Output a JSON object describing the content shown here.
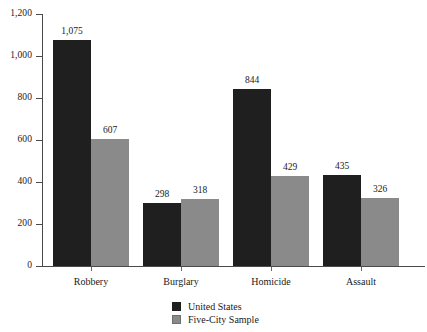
{
  "chart_data": {
    "type": "bar",
    "title": "",
    "xlabel": "",
    "ylabel": "",
    "categories": [
      "Robbery",
      "Burglary",
      "Homicide",
      "Assault"
    ],
    "series": [
      {
        "name": "United States",
        "color": "#1f1f1f",
        "values": [
          1075,
          298,
          844,
          435
        ],
        "labels": [
          "1,075",
          "298",
          "844",
          "435"
        ]
      },
      {
        "name": "Five-City Sample",
        "color": "#8a8a8a",
        "values": [
          607,
          318,
          429,
          326
        ],
        "labels": [
          "607",
          "318",
          "429",
          "326"
        ]
      }
    ],
    "ylim": [
      0,
      1200
    ],
    "yticks": [
      0,
      200,
      400,
      600,
      800,
      1000,
      1200
    ],
    "ytick_labels": [
      "0",
      "200",
      "400",
      "600",
      "800",
      "1,000",
      "1,200"
    ],
    "grid": false,
    "legend_position": "bottom-center",
    "background_color": "#ffffff",
    "axis_color": "#4a4a4a"
  },
  "legend": {
    "items": [
      {
        "label": "United States"
      },
      {
        "label": "Five-City Sample"
      }
    ]
  }
}
